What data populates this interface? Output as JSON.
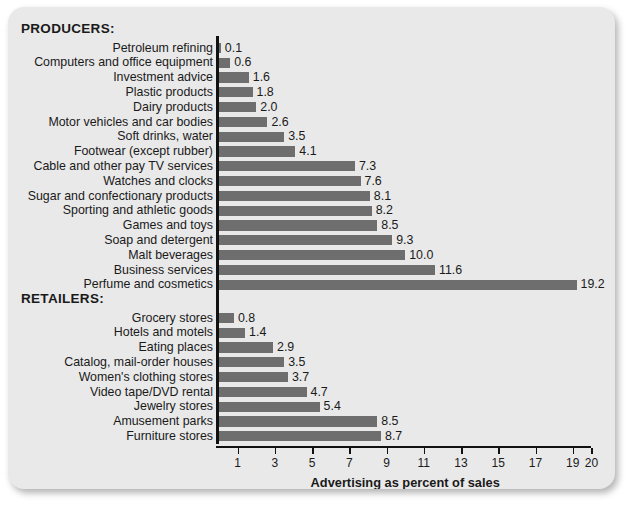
{
  "card": {
    "background_color": "#e9e9e9",
    "bar_color": "#6e6e6e",
    "axis_color": "#111111"
  },
  "sections": [
    {
      "id": "producers",
      "label": "PRODUCERS:"
    },
    {
      "id": "retailers",
      "label": "RETAILERS:"
    }
  ],
  "chart_data": {
    "type": "bar",
    "orientation": "horizontal",
    "title": "",
    "xlabel": "Advertising as percent of sales",
    "ylabel": "",
    "xlim": [
      0,
      20
    ],
    "xticks": [
      1,
      3,
      5,
      7,
      9,
      11,
      13,
      15,
      17,
      19,
      20
    ],
    "xticklabels": [
      "1",
      "3",
      "5",
      "7",
      "9",
      "11",
      "13",
      "15",
      "17",
      "19",
      "20"
    ],
    "grid": false,
    "legend": null,
    "groups": [
      {
        "name": "PRODUCERS:",
        "categories": [
          "Petroleum refining",
          "Computers and office equipment",
          "Investment advice",
          "Plastic products",
          "Dairy products",
          "Motor vehicles and car bodies",
          "Soft drinks, water",
          "Footwear (except rubber)",
          "Cable and other pay TV services",
          "Watches and clocks",
          "Sugar and confectionary products",
          "Sporting and athletic goods",
          "Games and toys",
          "Soap and detergent",
          "Malt beverages",
          "Business services",
          "Perfume and cosmetics"
        ],
        "values": [
          0.1,
          0.6,
          1.6,
          1.8,
          2.0,
          2.6,
          3.5,
          4.1,
          7.3,
          7.6,
          8.1,
          8.2,
          8.5,
          9.3,
          10.0,
          11.6,
          19.2
        ],
        "value_labels": [
          "0.1",
          "0.6",
          "1.6",
          "1.8",
          "2.0",
          "2.6",
          "3.5",
          "4.1",
          "7.3",
          "7.6",
          "8.1",
          "8.2",
          "8.5",
          "9.3",
          "10.0",
          "11.6",
          "19.2"
        ]
      },
      {
        "name": "RETAILERS:",
        "categories": [
          "Grocery stores",
          "Hotels and motels",
          "Eating places",
          "Catalog, mail-order houses",
          "Women's clothing stores",
          "Video tape/DVD rental",
          "Jewelry stores",
          "Amusement parks",
          "Furniture stores"
        ],
        "values": [
          0.8,
          1.4,
          2.9,
          3.5,
          3.7,
          4.7,
          5.4,
          8.5,
          8.7
        ],
        "value_labels": [
          "0.8",
          "1.4",
          "2.9",
          "3.5",
          "3.7",
          "4.7",
          "5.4",
          "8.5",
          "8.7"
        ]
      }
    ]
  }
}
